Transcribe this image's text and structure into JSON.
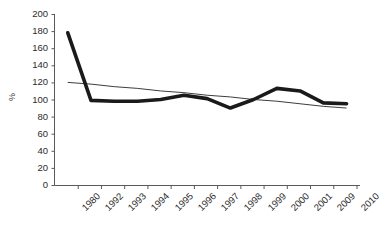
{
  "chart_data": {
    "type": "line",
    "title": "",
    "xlabel": "",
    "ylabel": "%",
    "categories": [
      "1980",
      "1992",
      "1993",
      "1994",
      "1995",
      "1996",
      "1997",
      "1998",
      "1999",
      "2000",
      "2001",
      "2009",
      "2010"
    ],
    "yticks": [
      0,
      20,
      40,
      60,
      80,
      100,
      120,
      140,
      160,
      180,
      200
    ],
    "ylim": [
      0,
      200
    ],
    "grid": false,
    "legend": "none",
    "series": [
      {
        "name": "value",
        "style": "thick-black-line",
        "color": "#1a1a1a",
        "values": [
          178,
          99,
          98,
          98,
          100,
          105,
          101,
          90,
          100,
          113,
          110,
          96,
          95
        ]
      },
      {
        "name": "linear-trend",
        "style": "thin-black-line",
        "color": "#3d3d3d",
        "values": [
          120,
          118,
          115,
          113,
          110,
          108,
          105,
          103,
          100,
          98,
          95,
          92,
          90
        ]
      }
    ]
  },
  "axes": {
    "y_title": "%",
    "y_tick_labels": [
      "200",
      "180",
      "160",
      "140",
      "120",
      "100",
      "80",
      "60",
      "40",
      "20",
      "0"
    ],
    "x_tick_labels": [
      "1980",
      "1992",
      "1993",
      "1994",
      "1995",
      "1996",
      "1997",
      "1998",
      "1999",
      "2000",
      "2001",
      "2009",
      "2010"
    ]
  }
}
